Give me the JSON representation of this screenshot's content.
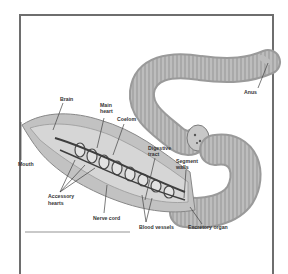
{
  "figure": {
    "labels": {
      "brain": "Brain",
      "main_heart": [
        "Main",
        "heart"
      ],
      "coelom": "Coelom",
      "mouth": "Mouth",
      "digestive_tract": [
        "Digestive",
        "tract"
      ],
      "segment_walls": [
        "Segment",
        "walls"
      ],
      "accessory_hearts": [
        "Accessory",
        "hearts"
      ],
      "nerve_cord": "Nerve cord",
      "blood_vessels": "Blood vessels",
      "excretory_organ": "Excretory organ",
      "anus": "Anus"
    },
    "colors": {
      "frame": "#6e6e6e",
      "body": "#b5b5b5",
      "body_dark": "#8c8c8c",
      "vessels": "#4a4a4a",
      "label": "#333333"
    }
  }
}
